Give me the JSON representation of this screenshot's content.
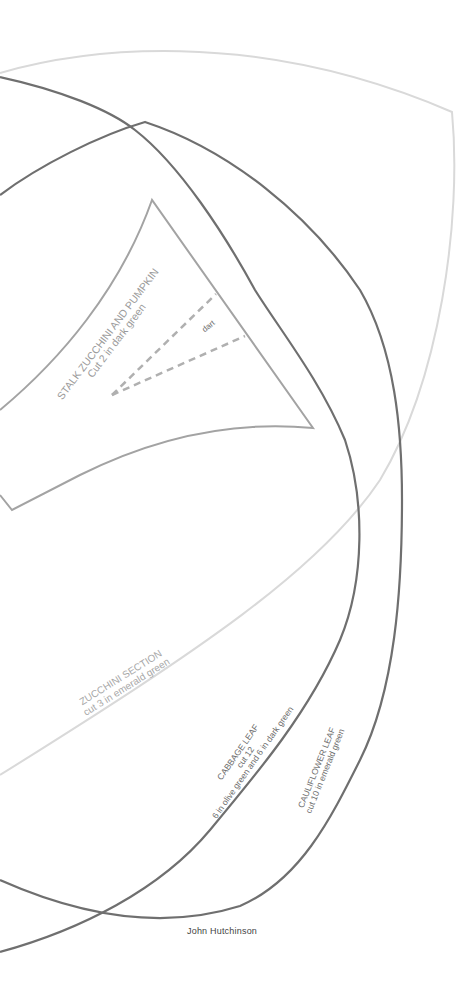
{
  "pieces": {
    "stalk": {
      "title": "STALK ZUCCHINI AND PUMPKIN",
      "instruction": "Cut 2 in dark green",
      "dart_label": "dart",
      "color": "#a3a3a3"
    },
    "zucchini_section": {
      "title": "ZUCCHINI SECTION",
      "instruction": "cut 3 in emerald green",
      "color": "#d9d9d9"
    },
    "cabbage_leaf": {
      "title": "CABBAGE LEAF",
      "instruction": "cut 12",
      "detail": "6 in olive green and 6 in dark green",
      "color": "#6f6f6f"
    },
    "cauliflower_leaf": {
      "title": "CAULIFLOWER LEAF",
      "instruction": "cut 10 in emerald green",
      "color": "#6f6f6f"
    }
  },
  "credit": "John Hutchinson"
}
